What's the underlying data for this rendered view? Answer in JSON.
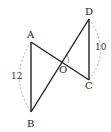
{
  "diagram": {
    "points": {
      "A": {
        "label": "A",
        "x": 31,
        "y": 42
      },
      "B": {
        "label": "B",
        "x": 31,
        "y": 112
      },
      "C": {
        "label": "C",
        "x": 89,
        "y": 80
      },
      "D": {
        "label": "D",
        "x": 89,
        "y": 19
      },
      "O": {
        "label": "O",
        "x": 63,
        "y": 61
      }
    },
    "segments": [
      "AB",
      "AC",
      "BD",
      "DC"
    ],
    "measures": {
      "AB": "12",
      "DC": "10"
    },
    "colors": {
      "line": "#222222",
      "arc": "#999999"
    }
  }
}
